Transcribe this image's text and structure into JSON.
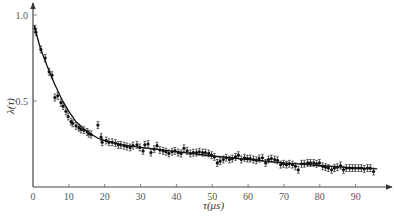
{
  "chart_data": {
    "type": "scatter",
    "title": "",
    "xlabel": "τ(μs)",
    "ylabel": "λ(τ)",
    "xlim": [
      0,
      99
    ],
    "ylim": [
      0,
      1.05
    ],
    "x_ticks": [
      0,
      10,
      20,
      30,
      40,
      50,
      60,
      70,
      80,
      90
    ],
    "x_tick_labels": [
      "0",
      "10",
      "20",
      "30",
      "40",
      "50",
      "60",
      "70",
      "80",
      "90"
    ],
    "y_ticks": [
      0.5,
      1.0
    ],
    "y_tick_labels": [
      "0.5",
      "1.0"
    ],
    "grid": false,
    "legend": "none",
    "series": [
      {
        "name": "measured",
        "kind": "points-with-error-bars",
        "error": 0.02,
        "points": [
          [
            0.6,
            0.92
          ],
          [
            0.8,
            0.9
          ],
          [
            2.2,
            0.8
          ],
          [
            3.4,
            0.75
          ],
          [
            4.5,
            0.67
          ],
          [
            5.3,
            0.65
          ],
          [
            6.1,
            0.52
          ],
          [
            6.9,
            0.53
          ],
          [
            7.8,
            0.49
          ],
          [
            8.4,
            0.47
          ],
          [
            9.2,
            0.44
          ],
          [
            9.8,
            0.41
          ],
          [
            10.6,
            0.38
          ],
          [
            11.1,
            0.37
          ],
          [
            12.0,
            0.355
          ],
          [
            12.8,
            0.345
          ],
          [
            13.4,
            0.335
          ],
          [
            14.2,
            0.33
          ],
          [
            15.1,
            0.32
          ],
          [
            15.6,
            0.31
          ],
          [
            16.2,
            0.305
          ],
          [
            18.1,
            0.36
          ],
          [
            19.0,
            0.29
          ],
          [
            19.3,
            0.26
          ],
          [
            20.4,
            0.27
          ],
          [
            21.2,
            0.26
          ],
          [
            22.1,
            0.26
          ],
          [
            23.0,
            0.255
          ],
          [
            23.8,
            0.245
          ],
          [
            24.5,
            0.245
          ],
          [
            25.4,
            0.24
          ],
          [
            26.2,
            0.235
          ],
          [
            27.1,
            0.23
          ],
          [
            27.9,
            0.24
          ],
          [
            29.0,
            0.245
          ],
          [
            29.8,
            0.23
          ],
          [
            30.7,
            0.21
          ],
          [
            31.2,
            0.245
          ],
          [
            32.1,
            0.25
          ],
          [
            32.9,
            0.2
          ],
          [
            33.8,
            0.22
          ],
          [
            34.6,
            0.24
          ],
          [
            35.4,
            0.215
          ],
          [
            36.3,
            0.21
          ],
          [
            37.1,
            0.205
          ],
          [
            37.9,
            0.195
          ],
          [
            38.8,
            0.205
          ],
          [
            39.6,
            0.21
          ],
          [
            40.5,
            0.2
          ],
          [
            41.3,
            0.195
          ],
          [
            42.1,
            0.225
          ],
          [
            43.0,
            0.21
          ],
          [
            43.9,
            0.195
          ],
          [
            44.7,
            0.2
          ],
          [
            45.6,
            0.2
          ],
          [
            46.4,
            0.205
          ],
          [
            47.3,
            0.2
          ],
          [
            48.1,
            0.2
          ],
          [
            49.0,
            0.195
          ],
          [
            49.8,
            0.185
          ],
          [
            50.6,
            0.175
          ],
          [
            51.4,
            0.14
          ],
          [
            52.2,
            0.15
          ],
          [
            53.1,
            0.16
          ],
          [
            53.9,
            0.17
          ],
          [
            54.8,
            0.16
          ],
          [
            55.6,
            0.165
          ],
          [
            56.5,
            0.175
          ],
          [
            57.3,
            0.185
          ],
          [
            58.1,
            0.16
          ],
          [
            59.0,
            0.17
          ],
          [
            59.8,
            0.165
          ],
          [
            60.6,
            0.165
          ],
          [
            61.5,
            0.16
          ],
          [
            62.3,
            0.155
          ],
          [
            63.1,
            0.165
          ],
          [
            64.0,
            0.17
          ],
          [
            64.9,
            0.14
          ],
          [
            65.7,
            0.16
          ],
          [
            66.5,
            0.165
          ],
          [
            67.4,
            0.16
          ],
          [
            68.2,
            0.155
          ],
          [
            69.1,
            0.13
          ],
          [
            69.9,
            0.135
          ],
          [
            70.7,
            0.13
          ],
          [
            71.5,
            0.135
          ],
          [
            72.4,
            0.13
          ],
          [
            73.2,
            0.12
          ],
          [
            74.0,
            0.1
          ],
          [
            74.9,
            0.135
          ],
          [
            75.7,
            0.135
          ],
          [
            76.6,
            0.14
          ],
          [
            77.4,
            0.14
          ],
          [
            78.3,
            0.14
          ],
          [
            79.1,
            0.135
          ],
          [
            79.9,
            0.14
          ],
          [
            80.8,
            0.12
          ],
          [
            81.6,
            0.115
          ],
          [
            82.4,
            0.11
          ],
          [
            83.3,
            0.1
          ],
          [
            84.1,
            0.11
          ],
          [
            84.9,
            0.115
          ],
          [
            85.8,
            0.125
          ],
          [
            86.6,
            0.1
          ],
          [
            87.4,
            0.11
          ],
          [
            88.3,
            0.11
          ],
          [
            89.1,
            0.11
          ],
          [
            89.9,
            0.11
          ],
          [
            90.8,
            0.11
          ],
          [
            91.6,
            0.11
          ],
          [
            92.4,
            0.105
          ],
          [
            93.3,
            0.11
          ],
          [
            94.1,
            0.11
          ],
          [
            95.0,
            0.09
          ]
        ]
      },
      {
        "name": "fit",
        "kind": "curve",
        "points": [
          [
            0.3,
            0.94
          ],
          [
            2,
            0.81
          ],
          [
            4,
            0.7
          ],
          [
            6,
            0.6
          ],
          [
            8,
            0.51
          ],
          [
            10,
            0.44
          ],
          [
            12,
            0.38
          ],
          [
            14,
            0.34
          ],
          [
            16,
            0.31
          ],
          [
            18,
            0.285
          ],
          [
            20,
            0.27
          ],
          [
            25,
            0.245
          ],
          [
            30,
            0.23
          ],
          [
            40,
            0.205
          ],
          [
            50,
            0.18
          ],
          [
            60,
            0.16
          ],
          [
            70,
            0.14
          ],
          [
            80,
            0.125
          ],
          [
            90,
            0.11
          ],
          [
            96,
            0.105
          ]
        ]
      }
    ]
  }
}
